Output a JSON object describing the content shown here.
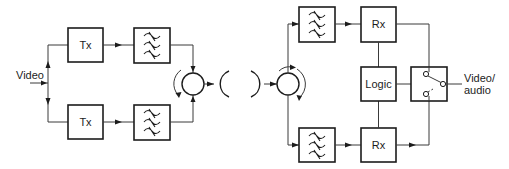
{
  "diagram": {
    "type": "block-diagram",
    "colors": {
      "line": "#1c1c1c",
      "background": "#ffffff"
    },
    "input": {
      "label": "Video"
    },
    "transmit_side": {
      "upper_chain": {
        "tx_label": "Tx",
        "filter": "band-pass-filter"
      },
      "lower_chain": {
        "tx_label": "Tx",
        "filter": "band-pass-filter"
      },
      "combiner": "circulator",
      "antenna": "dish-antenna"
    },
    "receive_side": {
      "antenna": "dish-antenna",
      "splitter": "circulator",
      "upper_chain": {
        "filter": "band-pass-filter",
        "rx_label": "Rx"
      },
      "lower_chain": {
        "filter": "band-pass-filter",
        "rx_label": "Rx"
      },
      "logic_label": "Logic",
      "switch": "selector-switch"
    },
    "output": {
      "label_line1": "Video/",
      "label_line2": "audio"
    }
  }
}
